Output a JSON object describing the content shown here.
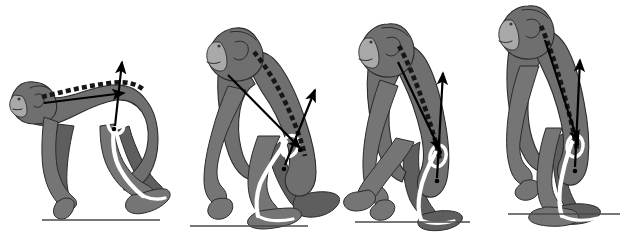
{
  "figure": {
    "title": "Evolution of hominid posture: four-stage sequence",
    "background_color": "#ffffff",
    "body_fill": "#6f6f6f",
    "body_fill_light": "#8a8a8a",
    "face_fill": "#a9a9a9",
    "outline_color": "#2b2b2b",
    "spine_color": "#1a1a1a",
    "arrow_color": "#000000",
    "skeleton_color": "#ffffff",
    "ground_color": "#4a4a4a",
    "panel_count": 4
  },
  "panels": [
    {
      "id": "panel-1",
      "name": "quadrupedal-knuckle-walking",
      "label": "1",
      "posture": "quadrupedal knuckle-walking",
      "trunk_angle_deg": 10,
      "ground_line": {
        "x1": 42,
        "x2": 160,
        "y": 220
      },
      "spine": {
        "orientation": "near-horizontal",
        "segments": 16
      },
      "arrows": [
        {
          "name": "trunk-line-arrow",
          "from": [
            44,
            103
          ],
          "to": [
            124,
            93
          ],
          "direction": "horizontal-anterior"
        },
        {
          "name": "hip-extensor-vector",
          "from": [
            115,
            126
          ],
          "to": [
            122,
            62
          ],
          "direction": "vertical-superior"
        }
      ]
    },
    {
      "id": "panel-2",
      "name": "crouched-bipedal-transition",
      "label": "2",
      "posture": "crouched transitional bipedal",
      "trunk_angle_deg": 45,
      "ground_line": {
        "x1": 190,
        "x2": 308,
        "y": 226
      },
      "spine": {
        "orientation": "oblique",
        "segments": 13
      },
      "arrows": [
        {
          "name": "trunk-line-arrow",
          "from": [
            228,
            75
          ],
          "to": [
            300,
            148
          ],
          "direction": "oblique-inferior"
        },
        {
          "name": "hip-extensor-vector",
          "from": [
            285,
            165
          ],
          "to": [
            315,
            90
          ],
          "direction": "oblique-superior"
        }
      ]
    },
    {
      "id": "panel-3",
      "name": "semi-erect-bipedal",
      "label": "3",
      "posture": "semi-erect bipedal striding",
      "trunk_angle_deg": 68,
      "ground_line": {
        "x1": 355,
        "x2": 470,
        "y": 222
      },
      "spine": {
        "orientation": "steep-oblique",
        "segments": 13
      },
      "arrows": [
        {
          "name": "trunk-line-arrow",
          "from": [
            398,
            62
          ],
          "to": [
            440,
            150
          ],
          "direction": "oblique-inferior"
        },
        {
          "name": "hip-extensor-vector",
          "from": [
            437,
            178
          ],
          "to": [
            443,
            73
          ],
          "direction": "vertical-superior"
        }
      ]
    },
    {
      "id": "panel-4",
      "name": "erect-bipedal-standing",
      "label": "4",
      "posture": "fully erect bipedal standing",
      "trunk_angle_deg": 82,
      "ground_line": {
        "x1": 508,
        "x2": 620,
        "y": 214
      },
      "spine": {
        "orientation": "near-vertical",
        "segments": 13
      },
      "arrows": [
        {
          "name": "trunk-line-arrow",
          "from": [
            545,
            40
          ],
          "to": [
            578,
            142
          ],
          "direction": "oblique-inferior"
        },
        {
          "name": "hip-extensor-vector",
          "from": [
            575,
            167
          ],
          "to": [
            580,
            60
          ],
          "direction": "vertical-superior"
        }
      ]
    }
  ],
  "legend_elements": {
    "spine_label": "vertebral column (dashed)",
    "arrow_label": "hip extensor force vector",
    "skeleton_label": "hindlimb skeleton (white)",
    "ground_label": "ground surface"
  }
}
